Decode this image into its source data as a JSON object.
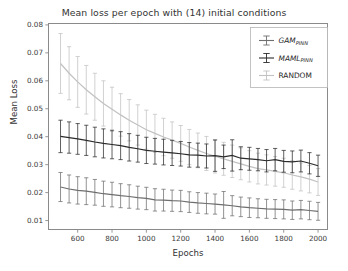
{
  "chart_data": {
    "type": "line",
    "title": "Mean loss per epoch with (14) initial conditions",
    "xlabel": "Epochs",
    "ylabel": "Mean Loss",
    "xlim": [
      430,
      2055
    ],
    "ylim": [
      0.0068,
      0.0805
    ],
    "grid": false,
    "legend_position": "upper right",
    "xticks": [
      600,
      800,
      1000,
      1200,
      1400,
      1600,
      1800,
      2000
    ],
    "xtick_labels": [
      "600",
      "800",
      "1000",
      "1200",
      "1400",
      "1600",
      "1800",
      "2000"
    ],
    "yticks": [
      0.01,
      0.02,
      0.03,
      0.04,
      0.05,
      0.06,
      0.07,
      0.08
    ],
    "ytick_labels": [
      "0.01",
      "0.02",
      "0.03",
      "0.04",
      "0.05",
      "0.06",
      "0.07",
      "0.08"
    ],
    "x": [
      500,
      550,
      600,
      650,
      700,
      750,
      800,
      850,
      900,
      950,
      1000,
      1050,
      1100,
      1150,
      1200,
      1250,
      1300,
      1350,
      1400,
      1450,
      1500,
      1550,
      1600,
      1650,
      1700,
      1750,
      1800,
      1850,
      1900,
      1950,
      2000
    ],
    "series": [
      {
        "name": "GAM_PINN",
        "label": "GAM",
        "label_sub": "PINN",
        "color": "#6e6e6e",
        "values": [
          0.022,
          0.0213,
          0.0208,
          0.0205,
          0.0201,
          0.0196,
          0.0193,
          0.0189,
          0.0186,
          0.0182,
          0.0179,
          0.0174,
          0.0173,
          0.0171,
          0.017,
          0.0166,
          0.0163,
          0.0161,
          0.0159,
          0.0156,
          0.0153,
          0.0149,
          0.0146,
          0.0144,
          0.0142,
          0.0141,
          0.014,
          0.0137,
          0.0139,
          0.0136,
          0.0133
        ],
        "errors": [
          0.0052,
          0.005,
          0.0049,
          0.0048,
          0.0046,
          0.0045,
          0.0044,
          0.0043,
          0.0042,
          0.0041,
          0.004,
          0.004,
          0.0039,
          0.0038,
          0.0038,
          0.0037,
          0.0037,
          0.0037,
          0.0036,
          0.0048,
          0.0036,
          0.0035,
          0.0035,
          0.0034,
          0.0034,
          0.0034,
          0.0034,
          0.0033,
          0.0033,
          0.0033,
          0.0032
        ]
      },
      {
        "name": "MAML_PINN",
        "label": "MAML",
        "label_sub": "PINN",
        "color": "#2b2b2b",
        "values": [
          0.0401,
          0.0397,
          0.0392,
          0.0387,
          0.0381,
          0.0376,
          0.0372,
          0.0368,
          0.0362,
          0.0357,
          0.0351,
          0.0348,
          0.0345,
          0.0342,
          0.0339,
          0.0335,
          0.0334,
          0.0331,
          0.0332,
          0.0328,
          0.0333,
          0.0323,
          0.0321,
          0.0318,
          0.0314,
          0.0318,
          0.0312,
          0.031,
          0.0313,
          0.0305,
          0.0296
        ],
        "errors": [
          0.0058,
          0.0056,
          0.0055,
          0.0054,
          0.0053,
          0.0052,
          0.0051,
          0.005,
          0.0049,
          0.0048,
          0.0047,
          0.0046,
          0.0046,
          0.0045,
          0.0044,
          0.0044,
          0.0043,
          0.0043,
          0.0056,
          0.0042,
          0.0056,
          0.0041,
          0.0041,
          0.004,
          0.004,
          0.004,
          0.0039,
          0.0039,
          0.0039,
          0.0038,
          0.0038
        ]
      },
      {
        "name": "RANDOM",
        "label": "RANDOM",
        "label_sub": "",
        "color": "#c2c2c2",
        "values": [
          0.0662,
          0.0627,
          0.0596,
          0.0568,
          0.0543,
          0.0519,
          0.0498,
          0.0478,
          0.0459,
          0.0442,
          0.0425,
          0.0412,
          0.0399,
          0.0388,
          0.0376,
          0.0363,
          0.0351,
          0.034,
          0.033,
          0.0321,
          0.0312,
          0.0303,
          0.0294,
          0.0286,
          0.0281,
          0.0276,
          0.0271,
          0.0263,
          0.0256,
          0.0248,
          0.0238
        ],
        "errors": [
          0.0107,
          0.0095,
          0.0091,
          0.0087,
          0.0084,
          0.0081,
          0.0079,
          0.0076,
          0.0074,
          0.0072,
          0.007,
          0.0068,
          0.0067,
          0.0065,
          0.0064,
          0.0063,
          0.0062,
          0.0061,
          0.006,
          0.0059,
          0.0058,
          0.0057,
          0.0056,
          0.0055,
          0.0054,
          0.0053,
          0.0052,
          0.0051,
          0.005,
          0.0049,
          0.0048
        ]
      }
    ]
  },
  "axes": {
    "title": "Mean loss per epoch with (14) initial conditions",
    "xlabel": "Epochs",
    "ylabel": "Mean Loss"
  },
  "legend": {
    "entries": [
      {
        "label": "GAM",
        "sub": "PINN",
        "italic": true
      },
      {
        "label": "MAML",
        "sub": "PINN",
        "italic": true
      },
      {
        "label": "RANDOM",
        "sub": "",
        "italic": false
      }
    ]
  }
}
